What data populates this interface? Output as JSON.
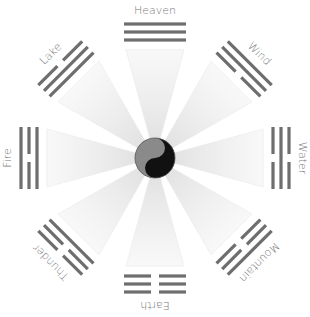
{
  "center": {
    "icon": "yin-yang-icon",
    "x": 155,
    "y": 158,
    "r": 20
  },
  "colors": {
    "line": "#6e6e6e",
    "label": "#777777",
    "wedge": "#e6e6e6",
    "yang_dark": "#111111",
    "yin_gray": "#8a8a8a"
  },
  "trigrams": [
    {
      "name": "Heaven",
      "angle": 0,
      "lines": [
        "solid",
        "solid",
        "solid"
      ]
    },
    {
      "name": "Wind",
      "angle": 45,
      "lines": [
        "solid",
        "solid",
        "broken"
      ]
    },
    {
      "name": "Water",
      "angle": 90,
      "lines": [
        "broken",
        "solid",
        "broken"
      ]
    },
    {
      "name": "Mountain",
      "angle": 135,
      "lines": [
        "solid",
        "broken",
        "broken"
      ]
    },
    {
      "name": "Earth",
      "angle": 180,
      "lines": [
        "broken",
        "broken",
        "broken"
      ]
    },
    {
      "name": "Thunder",
      "angle": 225,
      "lines": [
        "broken",
        "broken",
        "solid"
      ]
    },
    {
      "name": "Fire",
      "angle": 270,
      "lines": [
        "solid",
        "broken",
        "solid"
      ]
    },
    {
      "name": "Lake",
      "angle": 315,
      "lines": [
        "broken",
        "solid",
        "solid"
      ]
    }
  ]
}
